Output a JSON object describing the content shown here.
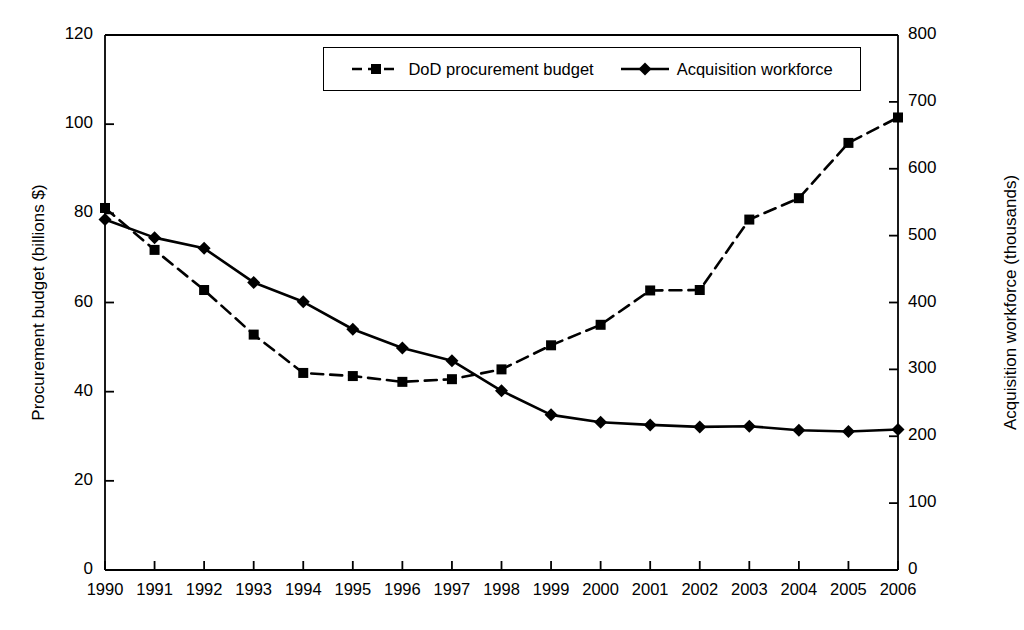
{
  "chart_data": {
    "type": "line",
    "title": "",
    "xlabel": "",
    "ylabel": "Procurement budget (billions $)",
    "y2label": "Acquisition workforce (thousands)",
    "x": [
      1990,
      1991,
      1992,
      1993,
      1994,
      1995,
      1996,
      1997,
      1998,
      1999,
      2000,
      2001,
      2002,
      2003,
      2004,
      2005,
      2006
    ],
    "categories": [
      "1990",
      "1991",
      "1992",
      "1993",
      "1994",
      "1995",
      "1996",
      "1997",
      "1998",
      "1999",
      "2000",
      "2001",
      "2002",
      "2003",
      "2004",
      "2005",
      "2006"
    ],
    "xticklabels": [
      "1990",
      "1991",
      "1992",
      "1993",
      "1994",
      "1995",
      "1996",
      "1997",
      "1998",
      "1999",
      "2000",
      "2001",
      "2002",
      "2003",
      "2004",
      "2005",
      "2006"
    ],
    "yticklabels": [
      "0",
      "20",
      "40",
      "60",
      "80",
      "100",
      "120"
    ],
    "yticks": [
      0,
      20,
      40,
      60,
      80,
      100,
      120
    ],
    "y2ticklabels": [
      "0",
      "100",
      "200",
      "300",
      "400",
      "500",
      "600",
      "700",
      "800"
    ],
    "y2ticks": [
      0,
      100,
      200,
      300,
      400,
      500,
      600,
      700,
      800
    ],
    "ylim": [
      0,
      120
    ],
    "y2lim": [
      0,
      800
    ],
    "grid": false,
    "legend_position": "top-center",
    "series": [
      {
        "name": "DoD procurement budget",
        "axis": "left",
        "units": "billions $",
        "marker": "square",
        "linestyle": "dashed",
        "color": "#000000",
        "values": [
          81.2,
          71.8,
          62.8,
          52.8,
          44.2,
          43.5,
          42.2,
          42.8,
          45.0,
          50.4,
          55.0,
          62.7,
          62.8,
          78.6,
          83.4,
          95.8,
          101.5
        ]
      },
      {
        "name": "Acquisition workforce",
        "axis": "right",
        "units": "thousands",
        "marker": "diamond",
        "linestyle": "solid",
        "color": "#000000",
        "values": [
          524,
          497,
          481,
          430,
          401,
          360,
          332,
          313,
          268,
          232,
          221,
          217,
          214,
          215,
          209,
          207,
          210
        ]
      }
    ]
  },
  "legend": {
    "entries": [
      {
        "label": "DoD procurement budget",
        "marker": "square",
        "linestyle": "dashed"
      },
      {
        "label": "Acquisition workforce",
        "marker": "diamond",
        "linestyle": "solid"
      }
    ]
  },
  "colors": {
    "axis": "#000000",
    "ink": "#000000",
    "background": "#ffffff"
  }
}
